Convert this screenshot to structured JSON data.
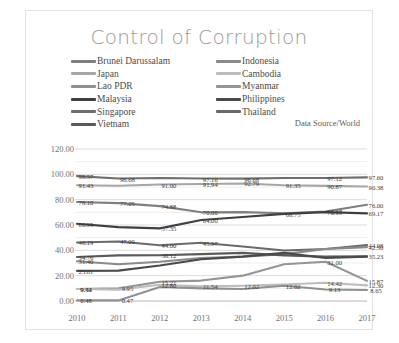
{
  "chart": {
    "title": "Control of Corruption",
    "source_note": "Data Source/World"
  },
  "legend": {
    "column1": [
      {
        "label": "Brunei Darussalam",
        "color": "#7f7f7f"
      },
      {
        "label": "Japan",
        "color": "#a6a6a6"
      },
      {
        "label": "Lao PDR",
        "color": "#909090"
      },
      {
        "label": "Malaysia",
        "color": "#3f3f3f"
      },
      {
        "label": "Singapore",
        "color": "#6e6e6e"
      },
      {
        "label": "Vietnam",
        "color": "#5a5a5a"
      }
    ],
    "column2": [
      {
        "label": "Indonesia",
        "color": "#8a8a8a"
      },
      {
        "label": "Cambodia",
        "color": "#bdbdbd"
      },
      {
        "label": "Myanmar",
        "color": "#949494"
      },
      {
        "label": "Philippines",
        "color": "#4a4a4a"
      },
      {
        "label": "Thailand",
        "color": "#6a6a6a"
      }
    ]
  },
  "chart_data": {
    "type": "line",
    "title": "Control of Corruption",
    "xlabel": "",
    "ylabel": "",
    "ylim": [
      0,
      120
    ],
    "yticks": [
      "0.00",
      "20.00",
      "40.00",
      "60.00",
      "80.00",
      "100.00",
      "120.00"
    ],
    "grid": true,
    "legend_position": "top",
    "x": [
      "2010",
      "2011",
      "2012",
      "2013",
      "2014",
      "2015",
      "2016",
      "2017"
    ],
    "series": [
      {
        "name": "Singapore",
        "color": "#6e6e6e",
        "values": [
          98.57,
          96.68,
          97.16,
          96.68,
          96.63,
          97.12,
          97.12,
          97.6
        ]
      },
      {
        "name": "Japan",
        "color": "#a6a6a6",
        "values": [
          91.43,
          91.0,
          91.94,
          92.42,
          92.79,
          91.35,
          90.87,
          90.38
        ]
      },
      {
        "name": "Brunei Darussalam",
        "color": "#7f7f7f",
        "values": [
          78.1,
          77.25,
          74.88,
          70.0,
          70.19,
          69.23,
          70.67,
          76.0
        ]
      },
      {
        "name": "Malaysia",
        "color": "#3f3f3f",
        "values": [
          60.95,
          58.29,
          57.35,
          64.0,
          66.35,
          68.75,
          70.19,
          69.17
        ]
      },
      {
        "name": "Thailand",
        "color": "#6a6a6a",
        "values": [
          46.19,
          47.0,
          44.0,
          45.97,
          43.0,
          39.9,
          41.0,
          44.08
        ]
      },
      {
        "name": "Indonesia",
        "color": "#8a8a8a",
        "values": [
          31.4,
          29.0,
          31.0,
          34.0,
          35.0,
          37.0,
          41.0,
          42.5
        ]
      },
      {
        "name": "Vietnam",
        "color": "#5a5a5a",
        "values": [
          34.76,
          36.0,
          36.12,
          37.0,
          38.0,
          36.0,
          35.0,
          35.23
        ]
      },
      {
        "name": "Philippines",
        "color": "#4a4a4a",
        "values": [
          23.81,
          24.0,
          28.0,
          33.0,
          35.0,
          38.0,
          34.0,
          35.0
        ]
      },
      {
        "name": "Myanmar",
        "color": "#949494",
        "values": [
          9.52,
          9.95,
          15.21,
          16.12,
          20.0,
          29.0,
          31.0,
          15.87
        ]
      },
      {
        "name": "Cambodia",
        "color": "#bdbdbd",
        "values": [
          9.44,
          9.0,
          12.8,
          11.54,
          12.02,
          13.0,
          14.42,
          12.3
        ]
      },
      {
        "name": "Lao PDR",
        "color": "#909090",
        "values": [
          0.48,
          0.47,
          11.0,
          10.0,
          9.5,
          12.02,
          9.13,
          8.65
        ]
      }
    ],
    "point_labels": [
      {
        "series": "Singapore",
        "x": "2010",
        "value": "98.57"
      },
      {
        "series": "Singapore",
        "x": "2011",
        "value": "96.68"
      },
      {
        "series": "Singapore",
        "x": "2013",
        "value": "97.16"
      },
      {
        "series": "Singapore",
        "x": "2014",
        "value": "96.68"
      },
      {
        "series": "Singapore",
        "x": "2016",
        "value": "97.12"
      },
      {
        "series": "Singapore",
        "x": "2017",
        "value": "97.60"
      },
      {
        "series": "Japan",
        "x": "2010",
        "value": "91.43"
      },
      {
        "series": "Japan",
        "x": "2012",
        "value": "91.00"
      },
      {
        "series": "Japan",
        "x": "2013",
        "value": "91.94"
      },
      {
        "series": "Japan",
        "x": "2014",
        "value": "92.79"
      },
      {
        "series": "Japan",
        "x": "2015",
        "value": "91.35"
      },
      {
        "series": "Japan",
        "x": "2016",
        "value": "90.87"
      },
      {
        "series": "Japan",
        "x": "2017",
        "value": "90.38"
      },
      {
        "series": "Brunei Darussalam",
        "x": "2010",
        "value": "78.10"
      },
      {
        "series": "Brunei Darussalam",
        "x": "2011",
        "value": "77.25"
      },
      {
        "series": "Brunei Darussalam",
        "x": "2012",
        "value": "74.88"
      },
      {
        "series": "Brunei Darussalam",
        "x": "2013",
        "value": "70.00"
      },
      {
        "series": "Brunei Darussalam",
        "x": "2016",
        "value": "70.67"
      },
      {
        "series": "Brunei Darussalam",
        "x": "2017",
        "value": "76.00"
      },
      {
        "series": "Malaysia",
        "x": "2010",
        "value": "60.95"
      },
      {
        "series": "Malaysia",
        "x": "2012",
        "value": "57.35"
      },
      {
        "series": "Malaysia",
        "x": "2013",
        "value": "64.00"
      },
      {
        "series": "Malaysia",
        "x": "2015",
        "value": "68.75"
      },
      {
        "series": "Malaysia",
        "x": "2016",
        "value": "70.19"
      },
      {
        "series": "Malaysia",
        "x": "2017",
        "value": "69.17"
      },
      {
        "series": "Thailand",
        "x": "2010",
        "value": "46.19"
      },
      {
        "series": "Thailand",
        "x": "2011",
        "value": "47.00"
      },
      {
        "series": "Thailand",
        "x": "2012",
        "value": "44.00"
      },
      {
        "series": "Thailand",
        "x": "2013",
        "value": "45.97"
      },
      {
        "series": "Thailand",
        "x": "2017",
        "value": "44.08"
      },
      {
        "series": "Indonesia",
        "x": "2010",
        "value": "31.40"
      },
      {
        "series": "Indonesia",
        "x": "2017",
        "value": "42.50"
      },
      {
        "series": "Vietnam",
        "x": "2010",
        "value": "34.76"
      },
      {
        "series": "Vietnam",
        "x": "2012",
        "value": "36.12"
      },
      {
        "series": "Vietnam",
        "x": "2017",
        "value": "35.23"
      },
      {
        "series": "Philippines",
        "x": "2010",
        "value": "23.81"
      },
      {
        "series": "Myanmar",
        "x": "2010",
        "value": "9.52"
      },
      {
        "series": "Myanmar",
        "x": "2011",
        "value": "9.95"
      },
      {
        "series": "Myanmar",
        "x": "2012",
        "value": "15.21"
      },
      {
        "series": "Myanmar",
        "x": "2016",
        "value": "31.00"
      },
      {
        "series": "Myanmar",
        "x": "2017",
        "value": "15.87"
      },
      {
        "series": "Cambodia",
        "x": "2010",
        "value": "9.44"
      },
      {
        "series": "Cambodia",
        "x": "2012",
        "value": "12.80"
      },
      {
        "series": "Cambodia",
        "x": "2013",
        "value": "11.54"
      },
      {
        "series": "Cambodia",
        "x": "2014",
        "value": "12.02"
      },
      {
        "series": "Cambodia",
        "x": "2016",
        "value": "14.42"
      },
      {
        "series": "Cambodia",
        "x": "2017",
        "value": "12.30"
      },
      {
        "series": "Lao PDR",
        "x": "2010",
        "value": "0.48"
      },
      {
        "series": "Lao PDR",
        "x": "2011",
        "value": "0.47"
      },
      {
        "series": "Lao PDR",
        "x": "2015",
        "value": "12.02"
      },
      {
        "series": "Lao PDR",
        "x": "2016",
        "value": "9.13"
      },
      {
        "series": "Lao PDR",
        "x": "2017",
        "value": "8.65"
      }
    ]
  }
}
